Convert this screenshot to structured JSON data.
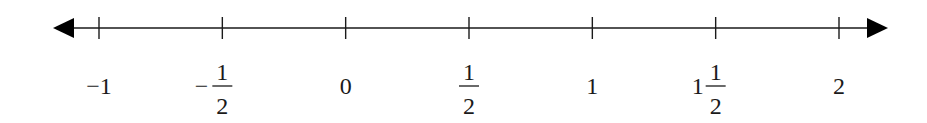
{
  "diagram": {
    "type": "number-line",
    "range": [
      -1,
      2
    ],
    "arrows": [
      "left",
      "right"
    ],
    "ticks": [
      {
        "value": -1,
        "label": {
          "kind": "plain",
          "text": "−1"
        }
      },
      {
        "value": -0.5,
        "label": {
          "kind": "fraction",
          "sign": "−",
          "whole": "",
          "num": "1",
          "den": "2"
        }
      },
      {
        "value": 0,
        "label": {
          "kind": "plain",
          "text": "0"
        }
      },
      {
        "value": 0.5,
        "label": {
          "kind": "fraction",
          "sign": "",
          "whole": "",
          "num": "1",
          "den": "2"
        }
      },
      {
        "value": 1,
        "label": {
          "kind": "plain",
          "text": "1"
        }
      },
      {
        "value": 1.5,
        "label": {
          "kind": "fraction",
          "sign": "",
          "whole": "1",
          "num": "1",
          "den": "2"
        }
      },
      {
        "value": 2,
        "label": {
          "kind": "plain",
          "text": "2"
        }
      }
    ],
    "colors": {
      "line": "#1a1a1a",
      "text": "#1a1a1a",
      "background": "#ffffff"
    }
  }
}
